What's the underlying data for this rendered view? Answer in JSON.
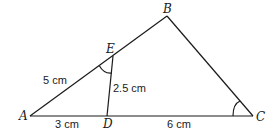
{
  "diagram": {
    "type": "triangle-similarity",
    "points": {
      "A": {
        "label": "A",
        "x": 30,
        "y": 116
      },
      "B": {
        "label": "B",
        "x": 167,
        "y": 16
      },
      "C": {
        "label": "C",
        "x": 253,
        "y": 116
      },
      "D": {
        "label": "D",
        "x": 107,
        "y": 116
      },
      "E": {
        "label": "E",
        "x": 113,
        "y": 56
      }
    },
    "segments": [
      {
        "from": "A",
        "to": "B"
      },
      {
        "from": "B",
        "to": "C"
      },
      {
        "from": "A",
        "to": "C"
      },
      {
        "from": "E",
        "to": "D"
      }
    ],
    "lengths": {
      "AE": "5 cm",
      "ED": "2.5 cm",
      "AD": "3 cm",
      "DC": "6 cm"
    },
    "marked_angles": [
      "AED",
      "ACB"
    ],
    "line_color": "#1a1a1a"
  }
}
